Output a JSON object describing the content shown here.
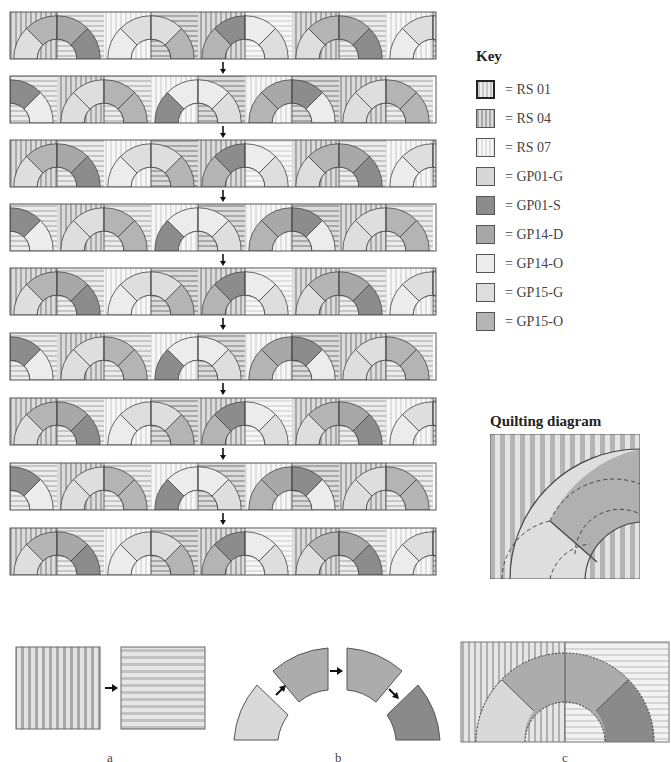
{
  "colors": {
    "RS01_a": "#c9c9c9",
    "RS01_b": "#ececec",
    "RS04_a": "#b0b0b0",
    "RS04_b": "#dcdcdc",
    "RS07_a": "#e2e2e2",
    "RS07_b": "#f6f6f6",
    "GP01-G": "#d7d7d7",
    "GP01-S": "#8c8c8c",
    "GP14-D": "#a8a8a8",
    "GP14-O": "#ececec",
    "GP15-G": "#dedede",
    "GP15-O": "#b4b4b4",
    "stroke": "#444444"
  },
  "key": {
    "title": "Key",
    "items": [
      {
        "code": "RS 01",
        "label": "= RS 01",
        "fill": "stripe-v-light",
        "thick": true
      },
      {
        "code": "RS 04",
        "label": "= RS 04",
        "fill": "stripe-v-mid"
      },
      {
        "code": "RS 07",
        "label": "= RS 07",
        "fill": "stripe-v-pale"
      },
      {
        "code": "GP01-G",
        "label": "= GP01-G",
        "fill": "#d7d7d7"
      },
      {
        "code": "GP01-S",
        "label": "= GP01-S",
        "fill": "#8c8c8c"
      },
      {
        "code": "GP14-D",
        "label": "= GP14-D",
        "fill": "#a8a8a8"
      },
      {
        "code": "GP14-O",
        "label": "= GP14-O",
        "fill": "#ececec"
      },
      {
        "code": "GP15-G",
        "label": "= GP15-G",
        "fill": "#dedede"
      },
      {
        "code": "GP15-O",
        "label": "= GP15-O",
        "fill": "#b4b4b4"
      }
    ]
  },
  "quilting_diagram": {
    "title": "Quilting diagram"
  },
  "layout_rows": {
    "count": 9,
    "row_tops": [
      12,
      76,
      140,
      204,
      268,
      333,
      398,
      463,
      528
    ],
    "row_left": 10,
    "row_width": 426,
    "row_height": 47,
    "arrow": "↓"
  },
  "blocks": {
    "pattern_A": [
      {
        "bg": [
          "RS04",
          "RS01"
        ],
        "arcs": [
          "GP15-G",
          "GP15-O",
          "GP14-D",
          "GP01-S"
        ]
      },
      {
        "bg": [
          "RS07",
          "RS04"
        ],
        "arcs": [
          "GP14-O",
          "GP15-G",
          "GP15-G",
          "GP15-O"
        ]
      },
      {
        "bg": [
          "RS04",
          "RS07"
        ],
        "arcs": [
          "GP15-O",
          "GP01-S",
          "GP14-O",
          "GP15-G"
        ]
      },
      {
        "bg": [
          "RS04",
          "RS01"
        ],
        "arcs": [
          "GP15-G",
          "GP15-O",
          "GP14-D",
          "GP01-S"
        ]
      },
      {
        "bg": [
          "RS07",
          "RS04"
        ],
        "arcs": [
          "GP14-O",
          "GP15-G",
          "GP15-G",
          "GP15-O"
        ]
      }
    ],
    "pattern_B": [
      {
        "bg": [
          "RS01",
          "RS01"
        ],
        "arcs": [
          "GP14-O",
          "GP01-S",
          "GP01-S",
          "GP14-O"
        ]
      },
      {
        "bg": [
          "RS04",
          "RS01"
        ],
        "arcs": [
          "GP15-G",
          "GP15-G",
          "GP15-O",
          "GP15-O"
        ]
      },
      {
        "bg": [
          "RS07",
          "RS04"
        ],
        "arcs": [
          "GP01-S",
          "GP14-O",
          "GP14-O",
          "GP15-G"
        ]
      },
      {
        "bg": [
          "RS07",
          "RS04"
        ],
        "arcs": [
          "GP15-O",
          "GP14-D",
          "GP01-S",
          "GP14-O"
        ]
      },
      {
        "bg": [
          "RS04",
          "RS01"
        ],
        "arcs": [
          "GP15-G",
          "GP15-G",
          "GP15-O",
          "GP15-O"
        ]
      }
    ]
  },
  "panels": {
    "a": {
      "caption": "a",
      "arrow": "→"
    },
    "b": {
      "caption": "b"
    },
    "c": {
      "caption": "c"
    }
  }
}
